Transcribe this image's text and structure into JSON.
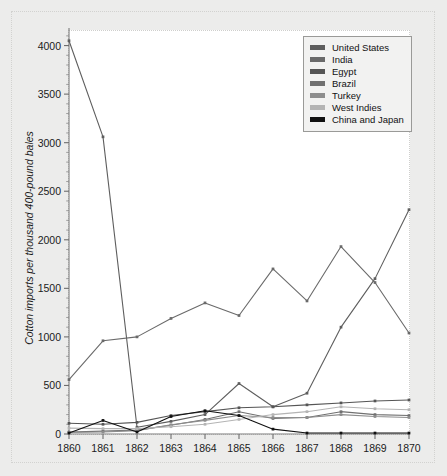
{
  "chart_data": {
    "type": "line",
    "title": "",
    "xlabel": "",
    "ylabel": "Cotton imports per thousand 400-pound bales",
    "x": [
      1860,
      1861,
      1862,
      1863,
      1864,
      1865,
      1866,
      1867,
      1868,
      1869,
      1870
    ],
    "xtick_labels": [
      "1860",
      "1861",
      "1862",
      "1863",
      "1864",
      "1865",
      "1866",
      "1867",
      "1868",
      "1869",
      "1870"
    ],
    "ytick_labels": [
      "0",
      "500",
      "1000",
      "1500",
      "2000",
      "2500",
      "3000",
      "3500",
      "4000"
    ],
    "ytick_values": [
      0,
      500,
      1000,
      1500,
      2000,
      2500,
      3000,
      3500,
      4000
    ],
    "xlim": [
      1860,
      1870
    ],
    "ylim": [
      0,
      4150
    ],
    "grid": false,
    "minor_ticks": true,
    "legend_position": "top-right",
    "series": [
      {
        "name": "United States",
        "color": "#5e5e5e",
        "values": [
          4050,
          3060,
          70,
          130,
          200,
          520,
          280,
          420,
          1100,
          1600,
          2310
        ]
      },
      {
        "name": "India",
        "color": "#6a6a6a",
        "values": [
          560,
          960,
          1000,
          1190,
          1350,
          1220,
          1700,
          1370,
          1930,
          1560,
          1040
        ]
      },
      {
        "name": "Egypt",
        "color": "#555555",
        "values": [
          110,
          100,
          120,
          190,
          230,
          270,
          280,
          300,
          320,
          340,
          350
        ]
      },
      {
        "name": "Brazil",
        "color": "#707070",
        "values": [
          20,
          30,
          40,
          90,
          150,
          230,
          160,
          170,
          230,
          200,
          190
        ]
      },
      {
        "name": "Turkey",
        "color": "#8d8d8d",
        "values": [
          15,
          20,
          35,
          95,
          140,
          190,
          170,
          170,
          200,
          180,
          170
        ]
      },
      {
        "name": "West Indies",
        "color": "#b4b4b4",
        "values": [
          60,
          55,
          55,
          75,
          100,
          150,
          200,
          230,
          280,
          260,
          250
        ]
      },
      {
        "name": "China and Japan",
        "color": "#111111",
        "values": [
          10,
          140,
          20,
          180,
          240,
          190,
          50,
          10,
          10,
          10,
          10
        ]
      }
    ]
  },
  "legend": {
    "items": [
      {
        "label": "United States"
      },
      {
        "label": "India"
      },
      {
        "label": "Egypt"
      },
      {
        "label": "Brazil"
      },
      {
        "label": "Turkey"
      },
      {
        "label": "West Indies"
      },
      {
        "label": "China and Japan"
      }
    ]
  }
}
